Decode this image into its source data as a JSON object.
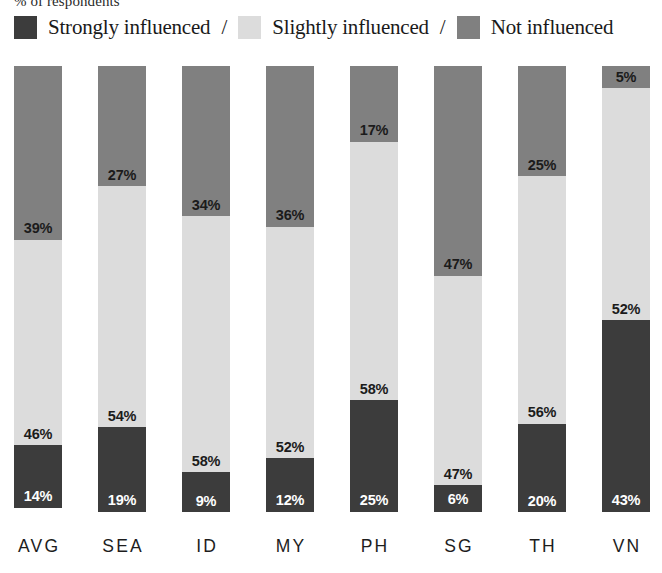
{
  "subtitle": "% of respondents",
  "legend": {
    "separator": "/",
    "entries": [
      {
        "label": "Strongly influenced",
        "color": "#3c3c3c",
        "key": "strongly"
      },
      {
        "label": "Slightly influenced",
        "color": "#dcdcdc",
        "key": "slightly"
      },
      {
        "label": "Not influenced",
        "color": "#808080",
        "key": "not"
      }
    ]
  },
  "chart_data": {
    "type": "bar",
    "subtype": "stacked-100",
    "title": "",
    "subtitle": "% of respondents",
    "xlabel": "",
    "ylabel": "",
    "ylim": [
      0,
      100
    ],
    "grid": false,
    "legend_position": "top",
    "orientation": "vertical",
    "value_suffix": "%",
    "categories": [
      "AVG",
      "SEA",
      "ID",
      "MY",
      "PH",
      "SG",
      "TH",
      "VN"
    ],
    "stack_order_top_to_bottom": [
      "Not influenced",
      "Slightly influenced",
      "Strongly influenced"
    ],
    "series": [
      {
        "name": "Strongly influenced",
        "color": "#3c3c3c",
        "values": [
          14,
          19,
          9,
          12,
          25,
          6,
          20,
          43
        ]
      },
      {
        "name": "Slightly influenced",
        "color": "#dcdcdc",
        "values": [
          46,
          54,
          58,
          52,
          58,
          47,
          56,
          52
        ]
      },
      {
        "name": "Not influenced",
        "color": "#808080",
        "values": [
          39,
          27,
          34,
          36,
          17,
          47,
          25,
          5
        ]
      }
    ],
    "labels": {
      "AVG": {
        "not": "39%",
        "slightly": "46%",
        "strongly": "14%"
      },
      "SEA": {
        "not": "27%",
        "slightly": "54%",
        "strongly": "19%"
      },
      "ID": {
        "not": "34%",
        "slightly": "58%",
        "strongly": "9%"
      },
      "MY": {
        "not": "36%",
        "slightly": "52%",
        "strongly": "12%"
      },
      "PH": {
        "not": "17%",
        "slightly": "58%",
        "strongly": "25%"
      },
      "SG": {
        "not": "47%",
        "slightly": "47%",
        "strongly": "6%"
      },
      "TH": {
        "not": "25%",
        "slightly": "56%",
        "strongly": "20%"
      },
      "VN": {
        "not": "5%",
        "slightly": "52%",
        "strongly": "43%"
      }
    }
  }
}
